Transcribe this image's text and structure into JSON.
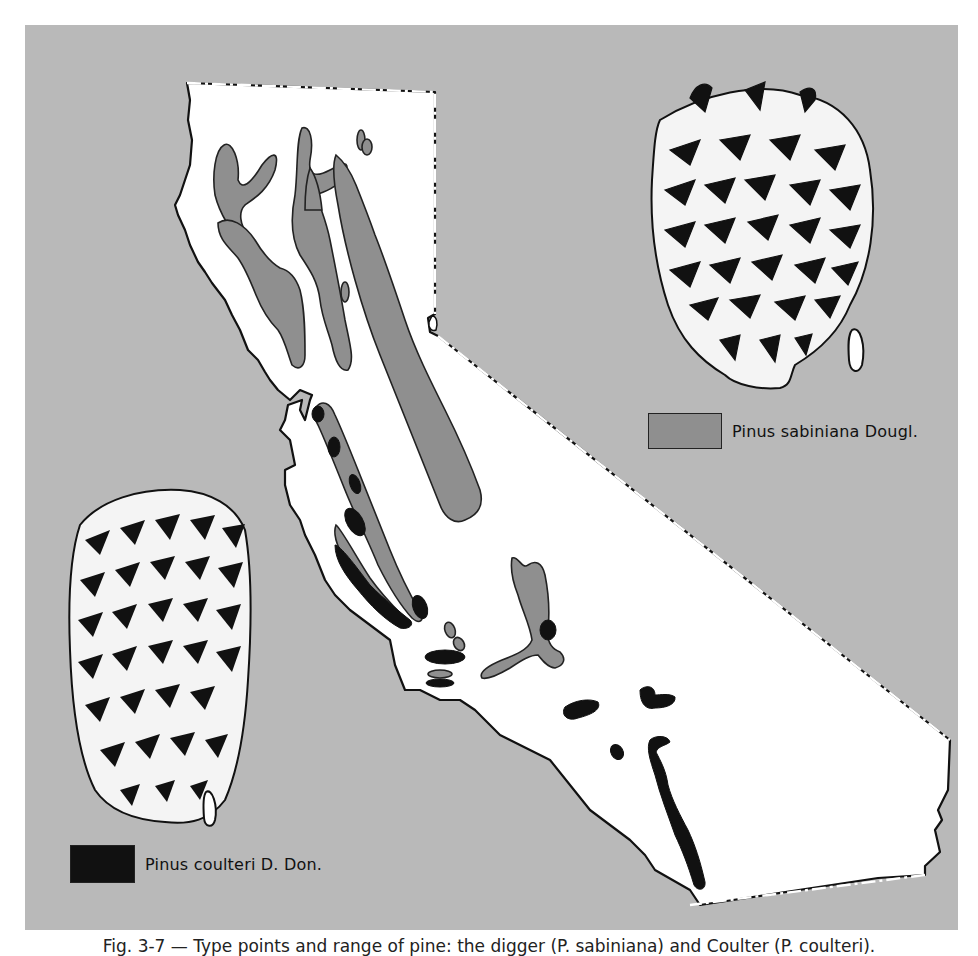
{
  "figure": {
    "caption": "Fig. 3-7 — Type points and range of pine: the digger (P. sabiniana) and Coulter (P. coulteri)."
  },
  "map": {
    "region": "California",
    "colors": {
      "background": "#b9b9b9",
      "land": "#ffffff",
      "sabiniana_range": "#8f8f8f",
      "coulteri_range": "#111111",
      "outline": "#111111"
    }
  },
  "legend": {
    "items": [
      {
        "label": "Pinus sabiniana Dougl.",
        "color": "#8f8f8f"
      },
      {
        "label": "Pinus coulteri D. Don.",
        "color": "#111111"
      }
    ]
  },
  "illustrations": {
    "top_right": "sabiniana-cone-with-seed",
    "bottom_left": "coulteri-cone-with-seed"
  }
}
